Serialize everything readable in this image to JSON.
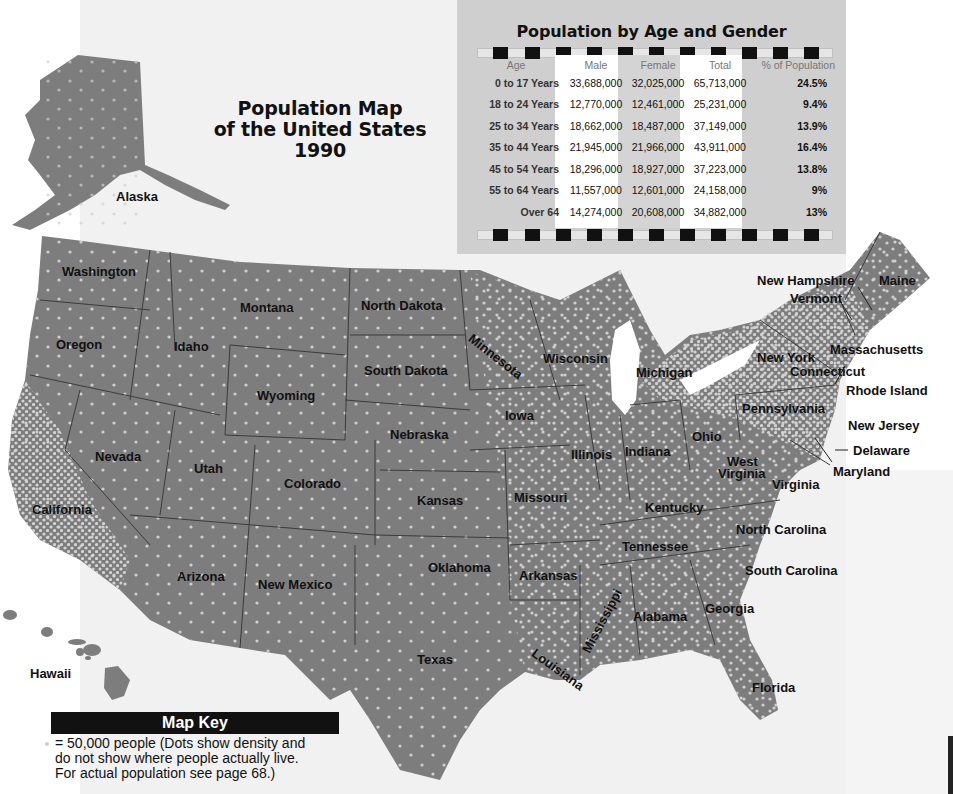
{
  "title": {
    "line1": "Population Map",
    "line2": "of the United States",
    "line3": "1990"
  },
  "colors": {
    "land": "#7d7d7d",
    "dots": "#cfcfcf",
    "border": "#3c3c3c",
    "table_bg": "#cfcfcf",
    "key_header_bg": "#111111"
  },
  "table": {
    "title": "Population by Age and Gender",
    "headers": [
      "Age",
      "Male",
      "Female",
      "Total",
      "% of Population"
    ],
    "rows": [
      {
        "age": "0 to 17 Years",
        "male": "33,688,000",
        "female": "32,025,000",
        "total": "65,713,000",
        "pct": "24.5%"
      },
      {
        "age": "18 to 24 Years",
        "male": "12,770,000",
        "female": "12,461,000",
        "total": "25,231,000",
        "pct": "9.4%"
      },
      {
        "age": "25 to 34 Years",
        "male": "18,662,000",
        "female": "18,487,000",
        "total": "37,149,000",
        "pct": "13.9%"
      },
      {
        "age": "35 to 44 Years",
        "male": "21,945,000",
        "female": "21,966,000",
        "total": "43,911,000",
        "pct": "16.4%"
      },
      {
        "age": "45 to 54 Years",
        "male": "18,296,000",
        "female": "18,927,000",
        "total": "37,223,000",
        "pct": "13.8%"
      },
      {
        "age": "55 to 64 Years",
        "male": "11,557,000",
        "female": "12,601,000",
        "total": "24,158,000",
        "pct": "9%"
      },
      {
        "age": "Over 64",
        "male": "14,274,000",
        "female": "20,608,000",
        "total": "34,882,000",
        "pct": "13%"
      }
    ]
  },
  "map_key": {
    "header": "Map Key",
    "symbol": "dot-icon",
    "line1": "= 50,000 people (Dots show density and",
    "line2": "do not show where people actually live.",
    "line3": "For actual population see page 68.)"
  },
  "states": [
    {
      "name": "Alaska",
      "x": 116,
      "y": 190,
      "rot": 0
    },
    {
      "name": "Hawaii",
      "x": 30,
      "y": 667,
      "rot": 0
    },
    {
      "name": "Washington",
      "x": 62,
      "y": 265,
      "rot": 0
    },
    {
      "name": "Oregon",
      "x": 56,
      "y": 338,
      "rot": 0
    },
    {
      "name": "California",
      "x": 32,
      "y": 503,
      "rot": 0
    },
    {
      "name": "Nevada",
      "x": 95,
      "y": 450,
      "rot": 0
    },
    {
      "name": "Idaho",
      "x": 174,
      "y": 340,
      "rot": 0
    },
    {
      "name": "Montana",
      "x": 240,
      "y": 301,
      "rot": 0
    },
    {
      "name": "Wyoming",
      "x": 257,
      "y": 389,
      "rot": 0
    },
    {
      "name": "Utah",
      "x": 194,
      "y": 462,
      "rot": 0
    },
    {
      "name": "Colorado",
      "x": 284,
      "y": 477,
      "rot": 0
    },
    {
      "name": "Arizona",
      "x": 177,
      "y": 570,
      "rot": 0
    },
    {
      "name": "New Mexico",
      "x": 258,
      "y": 578,
      "rot": 0
    },
    {
      "name": "North Dakota",
      "x": 361,
      "y": 299,
      "rot": 0
    },
    {
      "name": "South Dakota",
      "x": 364,
      "y": 364,
      "rot": 0
    },
    {
      "name": "Nebraska",
      "x": 390,
      "y": 428,
      "rot": 0
    },
    {
      "name": "Kansas",
      "x": 417,
      "y": 494,
      "rot": 0
    },
    {
      "name": "Oklahoma",
      "x": 428,
      "y": 561,
      "rot": 0
    },
    {
      "name": "Texas",
      "x": 417,
      "y": 653,
      "rot": 0
    },
    {
      "name": "Minnesota",
      "x": 476,
      "y": 316,
      "rot": 38
    },
    {
      "name": "Iowa",
      "x": 505,
      "y": 409,
      "rot": 0
    },
    {
      "name": "Missouri",
      "x": 514,
      "y": 491,
      "rot": 0
    },
    {
      "name": "Arkansas",
      "x": 519,
      "y": 569,
      "rot": 0
    },
    {
      "name": "Louisiana",
      "x": 533,
      "y": 660,
      "rot": 38
    },
    {
      "name": "Wisconsin",
      "x": 543,
      "y": 352,
      "rot": 0
    },
    {
      "name": "Illinois",
      "x": 571,
      "y": 448,
      "rot": 0
    },
    {
      "name": "Michigan",
      "x": 636,
      "y": 366,
      "rot": 0
    },
    {
      "name": "Indiana",
      "x": 625,
      "y": 445,
      "rot": 0
    },
    {
      "name": "Ohio",
      "x": 692,
      "y": 430,
      "rot": 0
    },
    {
      "name": "Kentucky",
      "x": 645,
      "y": 501,
      "rot": 0
    },
    {
      "name": "Tennessee",
      "x": 622,
      "y": 540,
      "rot": 0
    },
    {
      "name": "Mississippi",
      "x": 583,
      "y": 605,
      "rot": -62
    },
    {
      "name": "Alabama",
      "x": 633,
      "y": 610,
      "rot": 0
    },
    {
      "name": "Georgia",
      "x": 705,
      "y": 602,
      "rot": 0
    },
    {
      "name": "Florida",
      "x": 752,
      "y": 681,
      "rot": 0
    },
    {
      "name": "South Carolina",
      "x": 745,
      "y": 564,
      "rot": 0
    },
    {
      "name": "North Carolina",
      "x": 736,
      "y": 523,
      "rot": 0
    },
    {
      "name": "West",
      "x": 727,
      "y": 455,
      "rot": 0
    },
    {
      "name": "Virginia",
      "x": 718,
      "y": 467,
      "rot": 0
    },
    {
      "name": "Virginia",
      "x": 772,
      "y": 478,
      "rot": 0
    },
    {
      "name": "Pennsylvania",
      "x": 742,
      "y": 402,
      "rot": 0
    },
    {
      "name": "New York",
      "x": 757,
      "y": 351,
      "rot": 0
    },
    {
      "name": "Connecticut",
      "x": 790,
      "y": 365,
      "rot": 0
    },
    {
      "name": "Massachusetts",
      "x": 830,
      "y": 343,
      "rot": 0
    },
    {
      "name": "Rhode Island",
      "x": 846,
      "y": 384,
      "rot": 0
    },
    {
      "name": "New Jersey",
      "x": 848,
      "y": 419,
      "rot": 0
    },
    {
      "name": "Delaware",
      "x": 853,
      "y": 444,
      "rot": 0
    },
    {
      "name": "Maryland",
      "x": 833,
      "y": 465,
      "rot": 0
    },
    {
      "name": "Vermont",
      "x": 790,
      "y": 292,
      "rot": 0
    },
    {
      "name": "New Hampshire",
      "x": 757,
      "y": 274,
      "rot": 0
    },
    {
      "name": "Maine",
      "x": 879,
      "y": 274,
      "rot": 0
    }
  ]
}
